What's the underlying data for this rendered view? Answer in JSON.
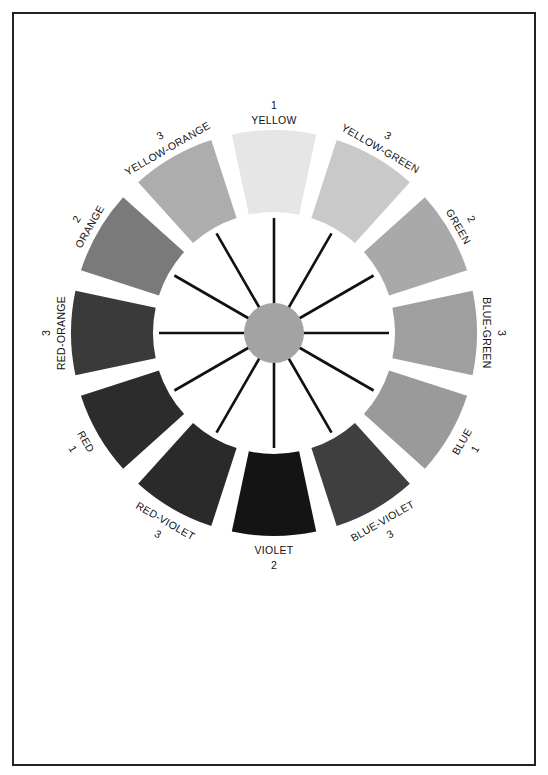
{
  "diagram": {
    "center": {
      "x": 274,
      "y": 333
    },
    "radii": {
      "outer": 203,
      "inner": 121,
      "spoke_outer": 115,
      "hub": 30
    },
    "segment_span_deg": 24,
    "hub_color": "#a3a3a3",
    "spoke_color": "#111111",
    "segments": [
      {
        "name": "YELLOW",
        "order": "1",
        "angle": 0,
        "color": "#e6e6e6"
      },
      {
        "name": "YELLOW-GREEN",
        "order": "3",
        "angle": 30,
        "color": "#c9c9c9"
      },
      {
        "name": "GREEN",
        "order": "2",
        "angle": 60,
        "color": "#a9a9a9"
      },
      {
        "name": "BLUE-GREEN",
        "order": "3",
        "angle": 90,
        "color": "#9f9f9f"
      },
      {
        "name": "BLUE",
        "order": "1",
        "angle": 120,
        "color": "#9a9a9a"
      },
      {
        "name": "BLUE-VIOLET",
        "order": "3",
        "angle": 150,
        "color": "#3f3f3f"
      },
      {
        "name": "VIOLET",
        "order": "2",
        "angle": 180,
        "color": "#141414"
      },
      {
        "name": "RED-VIOLET",
        "order": "3",
        "angle": 210,
        "color": "#2a2a2a"
      },
      {
        "name": "RED",
        "order": "1",
        "angle": 240,
        "color": "#2c2c2c"
      },
      {
        "name": "RED-ORANGE",
        "order": "3",
        "angle": 270,
        "color": "#3a3a3a"
      },
      {
        "name": "ORANGE",
        "order": "2",
        "angle": 300,
        "color": "#7a7a7a"
      },
      {
        "name": "YELLOW-ORANGE",
        "order": "3",
        "angle": 330,
        "color": "#adadad"
      }
    ],
    "legend_note": "1 = primary, 2 = secondary, 3 = tertiary"
  }
}
